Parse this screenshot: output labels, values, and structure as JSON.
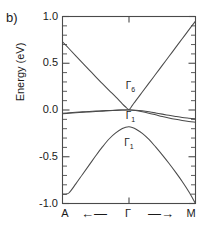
{
  "figure": {
    "panel_label": "b)"
  },
  "chart_data": {
    "type": "line",
    "title": "",
    "xlabel": "",
    "ylabel": "Energy (eV)",
    "xlim": [
      -1,
      1
    ],
    "ylim": [
      -1.0,
      1.0
    ],
    "grid": false,
    "legend": "none",
    "y_ticks": [
      1.0,
      0.5,
      0.0,
      -0.5,
      -1.0
    ],
    "y_tick_labels": [
      "1.0",
      "0.5",
      "0.0",
      "-0.5",
      "-1.0"
    ],
    "y_minor_tick_step": 0.1,
    "x_ticks": [
      0
    ],
    "x_tick_labels": [
      "Γ"
    ],
    "x_axis_endpoints": [
      "A",
      "M"
    ],
    "x_axis_arrows": [
      "←",
      "→"
    ],
    "line_color": "#4a4a4a",
    "frame_color": "#4a4a4a",
    "annotations": [
      {
        "text": "Γ6",
        "label": "Γ",
        "sub": "6",
        "x": 0.04,
        "y": 0.25
      },
      {
        "text": "Γ1",
        "label": "Γ",
        "sub": "1",
        "x": 0.04,
        "y": -0.08
      },
      {
        "text": "Γ1",
        "label": "Γ",
        "sub": "1",
        "x": 0.02,
        "y": -0.36
      }
    ],
    "series": [
      {
        "name": "upper-cone-band",
        "comment": "Dirac-like upper band: descends from A, crosses ~0 at Gamma, rises to M",
        "x": [
          -1.0,
          -0.9,
          -0.8,
          -0.7,
          -0.6,
          -0.5,
          -0.4,
          -0.3,
          -0.2,
          -0.1,
          -0.05,
          0.0,
          0.05,
          0.1,
          0.2,
          0.3,
          0.4,
          0.5,
          0.6,
          0.7,
          0.8,
          0.9,
          1.0
        ],
        "values": [
          0.73,
          0.655,
          0.58,
          0.505,
          0.43,
          0.355,
          0.282,
          0.21,
          0.14,
          0.066,
          0.032,
          0.005,
          0.05,
          0.098,
          0.192,
          0.287,
          0.382,
          0.477,
          0.572,
          0.667,
          0.762,
          0.857,
          0.95
        ]
      },
      {
        "name": "flat-band-upper",
        "comment": "Nearly flat band near E=0, slight hump at Gamma, decreasing toward M",
        "x": [
          -1.0,
          -0.9,
          -0.8,
          -0.7,
          -0.6,
          -0.5,
          -0.4,
          -0.3,
          -0.2,
          -0.1,
          0.0,
          0.1,
          0.2,
          0.3,
          0.4,
          0.5,
          0.6,
          0.7,
          0.8,
          0.9,
          1.0
        ],
        "values": [
          -0.035,
          -0.03,
          -0.025,
          -0.02,
          -0.016,
          -0.012,
          -0.008,
          -0.005,
          -0.002,
          0.0,
          0.002,
          -0.002,
          -0.009,
          -0.019,
          -0.031,
          -0.044,
          -0.057,
          -0.069,
          -0.08,
          -0.088,
          -0.095
        ]
      },
      {
        "name": "flat-band-lower",
        "comment": "Second flat band, degenerate with upper near Gamma, splits toward M",
        "x": [
          -1.0,
          -0.9,
          -0.8,
          -0.7,
          -0.6,
          -0.5,
          -0.4,
          -0.3,
          -0.2,
          -0.1,
          0.0,
          0.1,
          0.2,
          0.3,
          0.4,
          0.5,
          0.6,
          0.7,
          0.8,
          0.9,
          1.0
        ],
        "values": [
          -0.04,
          -0.035,
          -0.03,
          -0.025,
          -0.02,
          -0.016,
          -0.012,
          -0.008,
          -0.004,
          -0.001,
          0.0,
          -0.006,
          -0.018,
          -0.034,
          -0.052,
          -0.07,
          -0.086,
          -0.1,
          -0.112,
          -0.122,
          -0.13
        ]
      },
      {
        "name": "lower-valence-band",
        "comment": "Parabolic valence band peaking at about -0.18 eV at Gamma",
        "x": [
          -1.0,
          -0.95,
          -0.9,
          -0.8,
          -0.7,
          -0.6,
          -0.5,
          -0.4,
          -0.3,
          -0.2,
          -0.1,
          -0.05,
          0.0,
          0.05,
          0.1,
          0.2,
          0.3,
          0.4,
          0.5,
          0.6,
          0.7,
          0.8,
          0.9,
          1.0
        ],
        "values": [
          -0.9,
          -0.9,
          -0.885,
          -0.79,
          -0.69,
          -0.59,
          -0.49,
          -0.395,
          -0.31,
          -0.245,
          -0.198,
          -0.185,
          -0.18,
          -0.188,
          -0.203,
          -0.25,
          -0.315,
          -0.395,
          -0.48,
          -0.57,
          -0.665,
          -0.765,
          -0.875,
          -1.0
        ]
      }
    ]
  }
}
